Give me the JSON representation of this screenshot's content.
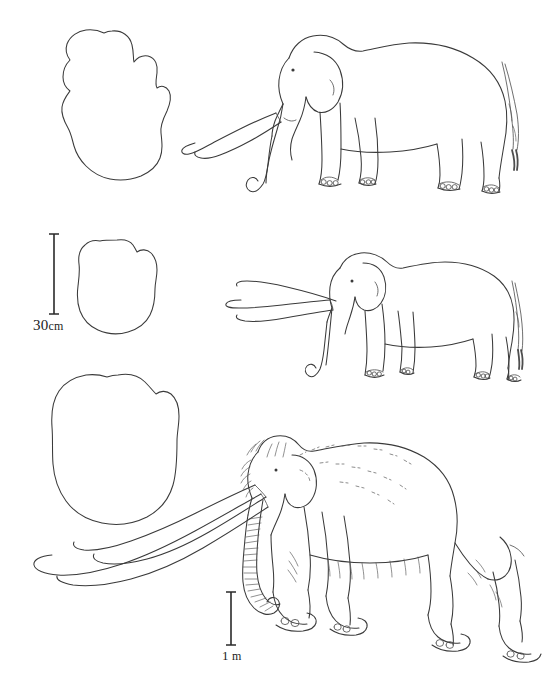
{
  "figure": {
    "kind": "scientific-line-illustration",
    "background_color": "#ffffff",
    "ink_color": "#3a3a3a"
  },
  "scale_bars": [
    {
      "id": "scale-30cm",
      "value": "30",
      "unit": "cm",
      "full_label": "30cm",
      "orientation": "vertical",
      "applies_to": "footprint outlines (rows 1 and 2)"
    },
    {
      "id": "scale-1m",
      "value": "1",
      "unit": "m",
      "full_label": "1 m",
      "orientation": "vertical",
      "applies_to": "lower mammoth figure and its footprint"
    }
  ],
  "rows": [
    {
      "index": 1,
      "footprint": {
        "name": "footprint-outline-top",
        "shape": "rounded outline with scalloped toe bumps along the upper margin"
      },
      "animal": {
        "name": "elephant-figure-top",
        "facing": "left",
        "features": [
          "curved tusks",
          "down-curling trunk",
          "large ear",
          "long tufted tail",
          "toenails on all feet"
        ]
      }
    },
    {
      "index": 2,
      "footprint": {
        "name": "footprint-outline-middle",
        "shape": "narrow oval outline with slight bumps on the upper margin"
      },
      "animal": {
        "name": "elephant-figure-middle",
        "facing": "left",
        "features": [
          "long straight forward-projecting tusks",
          "slender hanging trunk",
          "small ear",
          "tufted tail"
        ]
      }
    },
    {
      "index": 3,
      "footprint": {
        "name": "footprint-outline-bottom",
        "shape": "large broad rounded outline"
      },
      "animal": {
        "name": "mammoth-figure-bottom",
        "facing": "left",
        "features": [
          "domed head",
          "shaggy hair texture",
          "ringed trunk",
          "very long strongly curved tusks",
          "humped shoulder",
          "sloping back"
        ]
      }
    }
  ]
}
